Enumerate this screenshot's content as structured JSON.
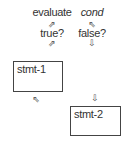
{
  "diagram": {
    "labels": {
      "evaluate": "evaluate",
      "cond": "cond",
      "true": "true?",
      "false": "false?"
    },
    "arrows": {
      "evaluate_to_true": "⇗",
      "cond_to_evaluate": "⇖",
      "true_to_stmt1": "⇗",
      "false_to_stmt2": "⇩",
      "stmt1_loop_back": "⇖",
      "false_down": "⇩"
    },
    "boxes": {
      "stmt1": "stmt-1",
      "stmt2": "stmt-2"
    }
  }
}
